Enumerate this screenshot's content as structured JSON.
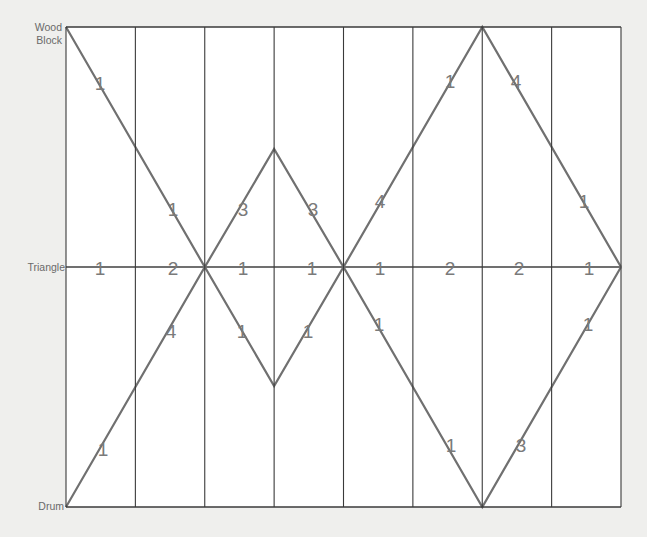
{
  "diagram": {
    "type": "rhythm-line-score",
    "rows": [
      {
        "id": "wood-block",
        "label_lines": [
          "Wood",
          "Block"
        ],
        "y": 27
      },
      {
        "id": "triangle",
        "label_lines": [
          "Triangle"
        ],
        "y": 267
      },
      {
        "id": "drum",
        "label_lines": [
          "Drum"
        ],
        "y": 507
      }
    ],
    "grid": {
      "left": 66,
      "right": 621,
      "top": 27,
      "bottom": 507,
      "columns": 8,
      "grid_color": "#3a3a3a",
      "line_color": "#707070",
      "cell_fill": "#ffffff",
      "number_color": "#7a7a7a"
    },
    "paths": [
      {
        "name": "upper-path",
        "points": [
          [
            66,
            27
          ],
          [
            204.8,
            267
          ],
          [
            274.1,
            149
          ],
          [
            343.5,
            267
          ],
          [
            482.3,
            27
          ],
          [
            621,
            267
          ]
        ]
      },
      {
        "name": "lower-path",
        "points": [
          [
            66,
            507
          ],
          [
            204.8,
            267
          ],
          [
            274.1,
            386
          ],
          [
            343.5,
            267
          ],
          [
            482.3,
            507
          ],
          [
            621,
            267
          ]
        ]
      },
      {
        "name": "triangle-line",
        "points": [
          [
            66,
            267
          ],
          [
            621,
            267
          ]
        ]
      }
    ],
    "numbers": [
      {
        "text": "1",
        "x": 100,
        "y": 90,
        "path": "upper"
      },
      {
        "text": "1",
        "x": 173,
        "y": 216,
        "path": "upper"
      },
      {
        "text": "3",
        "x": 243,
        "y": 216,
        "path": "upper"
      },
      {
        "text": "3",
        "x": 313,
        "y": 216,
        "path": "upper"
      },
      {
        "text": "4",
        "x": 380,
        "y": 208,
        "path": "upper"
      },
      {
        "text": "1",
        "x": 450,
        "y": 88,
        "path": "upper"
      },
      {
        "text": "4",
        "x": 516,
        "y": 88,
        "path": "upper"
      },
      {
        "text": "1",
        "x": 584,
        "y": 208,
        "path": "upper"
      },
      {
        "text": "1",
        "x": 100,
        "y": 275,
        "path": "triangle"
      },
      {
        "text": "2",
        "x": 173,
        "y": 275,
        "path": "triangle"
      },
      {
        "text": "1",
        "x": 243,
        "y": 275,
        "path": "triangle"
      },
      {
        "text": "1",
        "x": 312,
        "y": 275,
        "path": "triangle"
      },
      {
        "text": "1",
        "x": 380,
        "y": 275,
        "path": "triangle"
      },
      {
        "text": "2",
        "x": 450,
        "y": 275,
        "path": "triangle"
      },
      {
        "text": "2",
        "x": 519,
        "y": 275,
        "path": "triangle"
      },
      {
        "text": "1",
        "x": 589,
        "y": 275,
        "path": "triangle"
      },
      {
        "text": "1",
        "x": 103,
        "y": 456,
        "path": "lower"
      },
      {
        "text": "4",
        "x": 171,
        "y": 338,
        "path": "lower"
      },
      {
        "text": "1",
        "x": 242,
        "y": 338,
        "path": "lower"
      },
      {
        "text": "1",
        "x": 308,
        "y": 338,
        "path": "lower"
      },
      {
        "text": "1",
        "x": 379,
        "y": 331,
        "path": "lower"
      },
      {
        "text": "1",
        "x": 451,
        "y": 452,
        "path": "lower"
      },
      {
        "text": "3",
        "x": 521,
        "y": 452,
        "path": "lower"
      },
      {
        "text": "1",
        "x": 588,
        "y": 331,
        "path": "lower"
      }
    ]
  }
}
